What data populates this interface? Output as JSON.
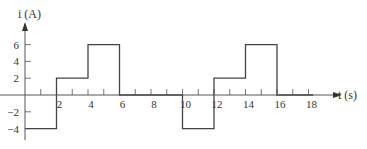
{
  "chart_data": {
    "type": "line",
    "subtype": "step",
    "title": "",
    "xlabel": "t (s)",
    "ylabel": "i (A)",
    "xlim": [
      0,
      19
    ],
    "ylim": [
      -5,
      8
    ],
    "x_ticks": [
      1,
      2,
      3,
      4,
      5,
      6,
      7,
      8,
      9,
      10,
      11,
      12,
      13,
      14,
      15,
      16,
      17,
      18
    ],
    "x_tick_labels": [
      "2",
      "4",
      "6",
      "8",
      "10",
      "12",
      "14",
      "16",
      "18"
    ],
    "x_tick_label_values": [
      2,
      4,
      6,
      8,
      10,
      12,
      14,
      16,
      18
    ],
    "y_ticks": [
      -4,
      -2,
      2,
      4,
      6
    ],
    "y_tick_labels": [
      "-4",
      "-2",
      "2",
      "4",
      "6"
    ],
    "grid": false,
    "legend": null,
    "series": [
      {
        "name": "i(t)",
        "color": "#444444",
        "points": [
          {
            "x": 0,
            "y": -4
          },
          {
            "x": 2,
            "y": -4
          },
          {
            "x": 2,
            "y": 2
          },
          {
            "x": 4,
            "y": 2
          },
          {
            "x": 4,
            "y": 6
          },
          {
            "x": 6,
            "y": 6
          },
          {
            "x": 6,
            "y": 0
          },
          {
            "x": 10,
            "y": 0
          },
          {
            "x": 10,
            "y": -4
          },
          {
            "x": 12,
            "y": -4
          },
          {
            "x": 12,
            "y": 2
          },
          {
            "x": 14,
            "y": 2
          },
          {
            "x": 14,
            "y": 6
          },
          {
            "x": 16,
            "y": 6
          },
          {
            "x": 16,
            "y": 0
          },
          {
            "x": 18.3,
            "y": 0
          }
        ]
      }
    ],
    "segments": [
      {
        "from": 0,
        "to": 2,
        "value": -4
      },
      {
        "from": 2,
        "to": 4,
        "value": 2
      },
      {
        "from": 4,
        "to": 6,
        "value": 6
      },
      {
        "from": 6,
        "to": 10,
        "value": 0
      },
      {
        "from": 10,
        "to": 12,
        "value": -4
      },
      {
        "from": 12,
        "to": 14,
        "value": 2
      },
      {
        "from": 14,
        "to": 16,
        "value": 6
      },
      {
        "from": 16,
        "to": 18,
        "value": 0
      }
    ]
  },
  "layout": {
    "origin_px": [
      25,
      95
    ],
    "px_per_x": 15.75,
    "px_per_y": 8.4,
    "x_axis_end_px": 333,
    "y_axis_top_px": 22
  }
}
